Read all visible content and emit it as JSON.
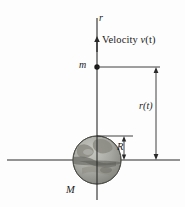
{
  "figure": {
    "background_color": "#fdfdfd",
    "line_color": "#2a2a2a",
    "labels": {
      "r_axis": "r",
      "velocity_prefix": "Velocity ",
      "velocity_symbol": "v",
      "velocity_arg": "(t)",
      "velocity_full": "Velocity v(t)",
      "point_mass": "m",
      "distance": "r(t)",
      "radius": "R",
      "central_mass": "M"
    },
    "body": {
      "name": "earth-sphere",
      "fill_color": "#9a9a94",
      "outline_color": "#555550",
      "center_x": 97,
      "center_y": 160,
      "radius_px": 24
    },
    "geometry": {
      "vertical_axis_x": 97,
      "vertical_axis_top_y": 18,
      "vertical_axis_bottom_y": 200,
      "horizontal_axis_y": 160,
      "horizontal_axis_left_x": 7,
      "horizontal_axis_right_x": 180,
      "mass_point_y": 67,
      "dimension_line_x": 156,
      "velocity_arrow_tip_y": 38,
      "velocity_arrow_tail_y": 52
    }
  }
}
